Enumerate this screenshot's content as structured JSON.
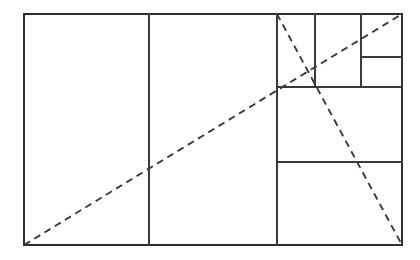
{
  "figure": {
    "type": "geometric-diagram",
    "background_color": "#ffffff",
    "line_color": "#3a3a3a",
    "frame_color": "#2e2e2e",
    "dash_pattern": "7 5",
    "canvas": {
      "width": 420,
      "height": 260
    },
    "outer_rectangle": {
      "x1": 24,
      "y1": 14,
      "x2": 402,
      "y2": 245,
      "width": 378,
      "height": 231
    },
    "solid_segments": [
      {
        "name": "square-1-divider",
        "x1": 149,
        "y1": 14,
        "x2": 149,
        "y2": 245
      },
      {
        "name": "square-2-divider",
        "x1": 277,
        "y1": 14,
        "x2": 277,
        "y2": 245
      },
      {
        "name": "square-3-horizontal",
        "x1": 277,
        "y1": 87,
        "x2": 402,
        "y2": 87
      },
      {
        "name": "square-4-horizontal",
        "x1": 277,
        "y1": 162,
        "x2": 402,
        "y2": 162
      },
      {
        "name": "square-5-divider",
        "x1": 315,
        "y1": 14,
        "x2": 315,
        "y2": 87
      },
      {
        "name": "square-6-divider",
        "x1": 361,
        "y1": 14,
        "x2": 361,
        "y2": 87
      },
      {
        "name": "square-7-divider",
        "x1": 361,
        "y1": 57,
        "x2": 402,
        "y2": 57
      }
    ],
    "dashed_segments": [
      {
        "name": "main-diagonal",
        "x1": 24,
        "y1": 245,
        "x2": 402,
        "y2": 14
      },
      {
        "name": "counter-diagonal",
        "x1": 277,
        "y1": 14,
        "x2": 402,
        "y2": 245
      }
    ]
  }
}
